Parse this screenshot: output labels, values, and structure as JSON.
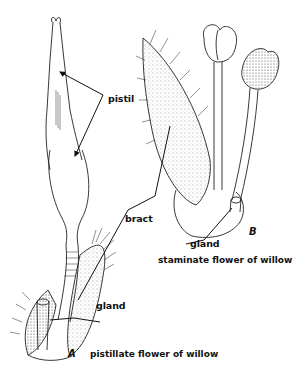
{
  "figure": {
    "panel_a": {
      "letter": "A",
      "caption": "pistillate flower of willow",
      "labels": {
        "pistil": "pistil",
        "bract": "bract",
        "gland": "gland"
      }
    },
    "panel_b": {
      "letter": "B",
      "caption": "staminate flower of willow",
      "labels": {
        "gland": "gland"
      }
    },
    "colors": {
      "ink": "#111111",
      "background": "#ffffff"
    }
  }
}
